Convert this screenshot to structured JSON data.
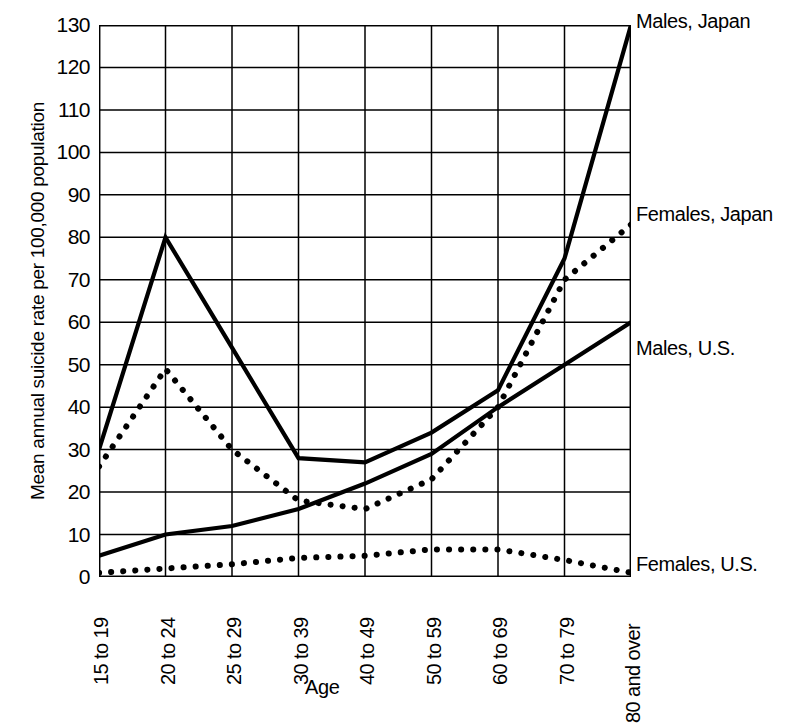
{
  "chart_data": {
    "type": "line",
    "title": "",
    "xlabel": "Age",
    "ylabel": "Mean annual suicide rate per 100,000 population",
    "categories": [
      "15 to 19",
      "20 to 24",
      "25 to 29",
      "30 to 39",
      "40 to 49",
      "50 to 59",
      "60 to 69",
      "70 to 79",
      "80 and over"
    ],
    "ylim": [
      0,
      130
    ],
    "yticks": [
      0,
      10,
      20,
      30,
      40,
      50,
      60,
      70,
      80,
      90,
      100,
      110,
      120,
      130
    ],
    "ytick_labels": [
      "0",
      "10",
      "20",
      "30",
      "40",
      "50",
      "60",
      "70",
      "80",
      "90",
      "100",
      "110",
      "120",
      "130"
    ],
    "grid": true,
    "legend_position": "right-inline-annotations",
    "series": [
      {
        "name": "Males, Japan",
        "style": "solid",
        "values": [
          30,
          80,
          54,
          28,
          27,
          34,
          44,
          75,
          130
        ]
      },
      {
        "name": "Females, Japan",
        "style": "dotted",
        "values": [
          26,
          49,
          30,
          18,
          16,
          23,
          40,
          70,
          83
        ]
      },
      {
        "name": "Males, U.S.",
        "style": "solid",
        "values": [
          5,
          10,
          12,
          16,
          22,
          29,
          40,
          50,
          60
        ]
      },
      {
        "name": "Females, U.S.",
        "style": "dotted",
        "values": [
          1,
          2,
          3,
          4.5,
          5,
          6.5,
          6.5,
          4,
          1
        ]
      }
    ],
    "colors": {
      "ink": "#000000",
      "grid": "#000000",
      "background": "#ffffff"
    }
  },
  "annotations": [
    {
      "label": "Males, Japan"
    },
    {
      "label": "Females, Japan"
    },
    {
      "label": "Males, U.S."
    },
    {
      "label": "Females, U.S."
    }
  ]
}
